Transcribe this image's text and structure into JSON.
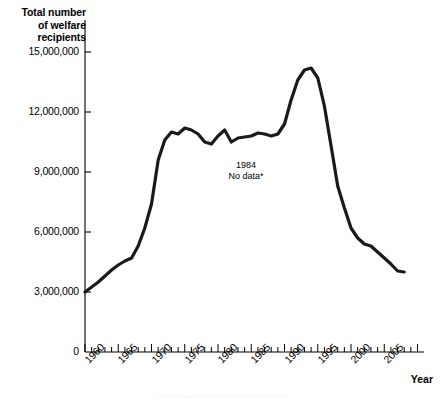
{
  "chart_data": {
    "type": "line",
    "title": "",
    "ylabel": "Total number of welfare recipients",
    "ylabel_lines": [
      "Total number",
      "of welfare",
      "recipients"
    ],
    "xlabel": "Year",
    "ylim": [
      0,
      16500000
    ],
    "xlim": [
      1960,
      2011
    ],
    "grid": false,
    "legend": null,
    "ytick_labels": [
      "15,000,000",
      "12,000,000",
      "9,000,000",
      "6,000,000",
      "3,000,000",
      "0"
    ],
    "ytick_values": [
      15000000,
      12000000,
      9000000,
      6000000,
      3000000,
      0
    ],
    "xtick_labels": [
      "1960",
      "1965",
      "1970",
      "1975",
      "1980",
      "1985",
      "1990",
      "1995",
      "2000",
      "2005"
    ],
    "xtick_values": [
      1960,
      1965,
      1970,
      1975,
      1980,
      1985,
      1990,
      1995,
      2000,
      2005
    ],
    "minor_xtick_interval": 1,
    "annotations": [
      {
        "name": "no-data-note",
        "lines": [
          "1984",
          "No data*"
        ],
        "x": 1984,
        "y": 9700000
      }
    ],
    "series": [
      {
        "name": "Total welfare recipients",
        "color": "#1a1a1a",
        "gaps": [
          [
            1983.5,
            1985.2
          ]
        ],
        "x": [
          1960,
          1961,
          1962,
          1963,
          1964,
          1965,
          1966,
          1967,
          1968,
          1969,
          1970,
          1971,
          1972,
          1973,
          1974,
          1975,
          1976,
          1977,
          1978,
          1979,
          1980,
          1981,
          1982,
          1983,
          1985,
          1986,
          1987,
          1988,
          1989,
          1990,
          1991,
          1992,
          1993,
          1994,
          1995,
          1996,
          1997,
          1998,
          1999,
          2000,
          2001,
          2002,
          2003,
          2004,
          2005,
          2006,
          2007,
          2008
        ],
        "values": [
          3000000,
          3250000,
          3500000,
          3800000,
          4100000,
          4350000,
          4550000,
          4700000,
          5300000,
          6200000,
          7400000,
          9600000,
          10600000,
          11000000,
          10900000,
          11200000,
          11100000,
          10900000,
          10500000,
          10400000,
          10800000,
          11100000,
          10500000,
          10700000,
          10800000,
          10950000,
          10900000,
          10800000,
          10900000,
          11400000,
          12600000,
          13600000,
          14100000,
          14200000,
          13700000,
          12300000,
          10300000,
          8300000,
          7200000,
          6200000,
          5700000,
          5400000,
          5300000,
          5000000,
          4700000,
          4400000,
          4050000,
          4000000
        ]
      }
    ]
  },
  "axis_geometry": {
    "x0_px": 85,
    "x1_px": 424,
    "y0_px": 352,
    "px_per_year": 6.65,
    "y_value_top": 16500000,
    "y_top_px": 22
  },
  "footer": {
    "text": "··································································"
  }
}
